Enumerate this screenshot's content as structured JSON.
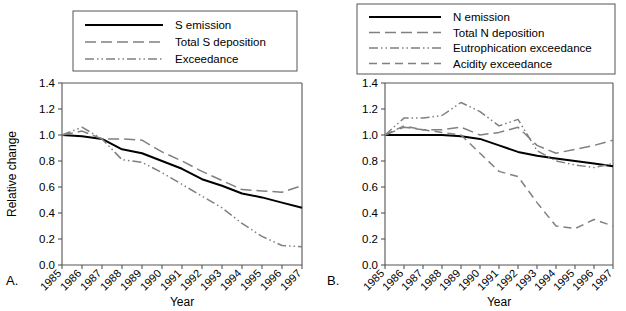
{
  "figure": {
    "panels": [
      {
        "letter": "A.",
        "xlabel": "Year",
        "ylabel": "Relative change"
      },
      {
        "letter": "B.",
        "xlabel": "Year",
        "ylabel": ""
      }
    ]
  },
  "chart_data": [
    {
      "type": "line",
      "panel": "A.",
      "title": "",
      "xlabel": "Year",
      "ylabel": "Relative change",
      "ylim": [
        0.0,
        1.4
      ],
      "yticks": [
        "0.0",
        "0.2",
        "0.4",
        "0.6",
        "0.8",
        "1.0",
        "1.2",
        "1.4"
      ],
      "grid": false,
      "legend_position": "top-center",
      "categories": [
        "1985",
        "1986",
        "1987",
        "1988",
        "1989",
        "1990",
        "1991",
        "1992",
        "1993",
        "1994",
        "1995",
        "1996",
        "1997"
      ],
      "series": [
        {
          "name": "S emission",
          "style": "solid",
          "color": "#000000",
          "values": [
            1.0,
            0.99,
            0.97,
            0.89,
            0.86,
            0.8,
            0.74,
            0.66,
            0.61,
            0.55,
            0.52,
            0.48,
            0.44
          ]
        },
        {
          "name": "Total S deposition",
          "style": "long-dash",
          "color": "#808080",
          "values": [
            1.0,
            1.03,
            0.97,
            0.97,
            0.96,
            0.87,
            0.8,
            0.72,
            0.65,
            0.58,
            0.57,
            0.56,
            0.61
          ]
        },
        {
          "name": "Exceedance",
          "style": "dash-dot-dot",
          "color": "#808080",
          "values": [
            1.0,
            1.06,
            0.97,
            0.81,
            0.79,
            0.71,
            0.62,
            0.53,
            0.44,
            0.32,
            0.22,
            0.15,
            0.14
          ]
        }
      ]
    },
    {
      "type": "line",
      "panel": "B.",
      "title": "",
      "xlabel": "Year",
      "ylabel": "",
      "ylim": [
        0.0,
        1.4
      ],
      "yticks": [
        "0.0",
        "0.2",
        "0.4",
        "0.6",
        "0.8",
        "1.0",
        "1.2",
        "1.4"
      ],
      "grid": false,
      "legend_position": "top-center",
      "categories": [
        "1985",
        "1986",
        "1987",
        "1988",
        "1989",
        "1990",
        "1991",
        "1992",
        "1993",
        "1994",
        "1995",
        "1996",
        "1997"
      ],
      "series": [
        {
          "name": "N emission",
          "style": "solid",
          "color": "#000000",
          "values": [
            1.0,
            1.0,
            1.0,
            1.0,
            0.99,
            0.97,
            0.92,
            0.87,
            0.84,
            0.82,
            0.8,
            0.78,
            0.76
          ]
        },
        {
          "name": "Total N deposition",
          "style": "long-dash",
          "color": "#808080",
          "values": [
            1.0,
            1.06,
            1.04,
            1.04,
            1.06,
            1.0,
            1.02,
            1.06,
            0.92,
            0.86,
            0.89,
            0.92,
            0.96
          ]
        },
        {
          "name": "Eutrophication exceedance",
          "style": "dash-dot-dot",
          "color": "#808080",
          "values": [
            1.0,
            1.13,
            1.13,
            1.15,
            1.25,
            1.18,
            1.07,
            1.12,
            0.88,
            0.8,
            0.77,
            0.75,
            0.78
          ]
        },
        {
          "name": "Acidity exceedance",
          "style": "medium-dash",
          "color": "#808080",
          "values": [
            1.0,
            1.07,
            1.04,
            1.02,
            1.0,
            0.86,
            0.72,
            0.68,
            0.48,
            0.3,
            0.28,
            0.35,
            0.3
          ]
        }
      ]
    }
  ]
}
